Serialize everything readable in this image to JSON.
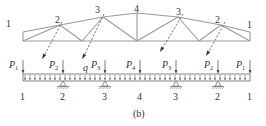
{
  "figure": {
    "caption": "(b)",
    "truss": {
      "node_labels": [
        {
          "id": "node-1-left",
          "text": "1",
          "x": 6,
          "y": 27
        },
        {
          "id": "node-2-left",
          "text": "2",
          "x": 55,
          "y": 23
        },
        {
          "id": "node-3-left",
          "text": "3",
          "x": 95,
          "y": 13
        },
        {
          "id": "node-4",
          "text": "4",
          "x": 134,
          "y": 12
        },
        {
          "id": "node-3-right",
          "text": "3",
          "x": 176,
          "y": 15
        },
        {
          "id": "node-2-right",
          "text": "2",
          "x": 215,
          "y": 23
        },
        {
          "id": "node-1-right",
          "text": "1",
          "x": 247,
          "y": 28
        }
      ]
    },
    "beam": {
      "distributed_load_label": "q",
      "loads": [
        {
          "id": "P1-left",
          "symbol": "P",
          "sub": "1",
          "x": 23
        },
        {
          "id": "P2-left",
          "symbol": "P",
          "sub": "2",
          "x": 63
        },
        {
          "id": "P3-left",
          "symbol": "P",
          "sub": "3",
          "x": 105
        },
        {
          "id": "P4",
          "symbol": "P",
          "sub": "4",
          "x": 140
        },
        {
          "id": "P3-right",
          "symbol": "P",
          "sub": "3",
          "x": 176
        },
        {
          "id": "P2-right",
          "symbol": "P",
          "sub": "2",
          "x": 218
        },
        {
          "id": "P1-right",
          "symbol": "P",
          "sub": "1",
          "x": 250
        }
      ],
      "node_labels": [
        {
          "id": "beam-node-1-left",
          "text": "1",
          "x": 23
        },
        {
          "id": "beam-node-2-left",
          "text": "2",
          "x": 63
        },
        {
          "id": "beam-node-3-left",
          "text": "3",
          "x": 105
        },
        {
          "id": "beam-node-4",
          "text": "4",
          "x": 140
        },
        {
          "id": "beam-node-3-right",
          "text": "3",
          "x": 176
        },
        {
          "id": "beam-node-2-right",
          "text": "2",
          "x": 218
        },
        {
          "id": "beam-node-1-right",
          "text": "1",
          "x": 250
        }
      ],
      "supports_at_nodes": [
        "2",
        "3",
        "3",
        "2"
      ]
    }
  }
}
